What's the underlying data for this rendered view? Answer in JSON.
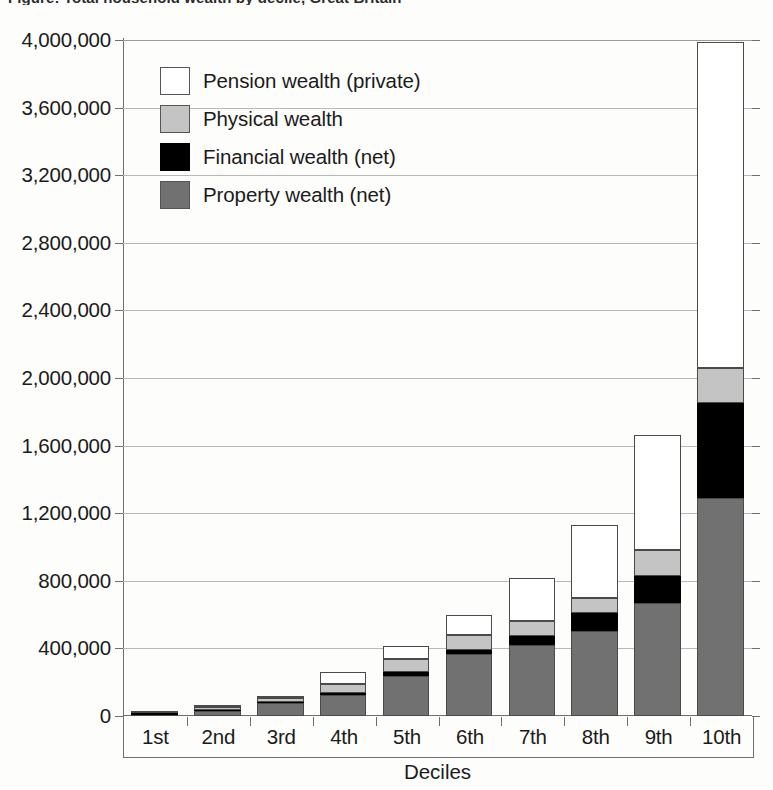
{
  "figure": {
    "clipped_title": "Figure: Total household wealth by decile, Great Britain",
    "xaxis_title": "Deciles"
  },
  "legend": {
    "items": [
      {
        "label": "Pension wealth (private)",
        "key": "pension",
        "color": "#ffffff"
      },
      {
        "label": "Physical wealth",
        "key": "physical",
        "color": "#c4c4c4"
      },
      {
        "label": "Financial wealth (net)",
        "key": "financial",
        "color": "#000000"
      },
      {
        "label": "Property wealth (net)",
        "key": "property",
        "color": "#717171"
      }
    ]
  },
  "yaxis": {
    "ticks": [
      {
        "value": 4000000,
        "label": "4,000,000"
      },
      {
        "value": 3600000,
        "label": "3,600,000"
      },
      {
        "value": 3200000,
        "label": "3,200,000"
      },
      {
        "value": 2800000,
        "label": "2,800,000"
      },
      {
        "value": 2400000,
        "label": "2,400,000"
      },
      {
        "value": 2000000,
        "label": "2,000,000"
      },
      {
        "value": 1600000,
        "label": "1,600,000"
      },
      {
        "value": 1200000,
        "label": "1,200,000"
      },
      {
        "value": 800000,
        "label": "800,000"
      },
      {
        "value": 400000,
        "label": "400,000"
      },
      {
        "value": 0,
        "label": "0"
      }
    ]
  },
  "chart_data": {
    "type": "bar",
    "stacked": true,
    "title": "Total household wealth by decile",
    "xlabel": "Deciles",
    "ylabel": "",
    "ylim": [
      0,
      4000000
    ],
    "ytick_step": 400000,
    "grid": true,
    "legend_position": "inside-top-left",
    "categories": [
      "1st",
      "2nd",
      "3rd",
      "4th",
      "5th",
      "6th",
      "7th",
      "8th",
      "9th",
      "10th"
    ],
    "series": [
      {
        "name": "Property wealth (net)",
        "color": "#717171",
        "values": [
          8000,
          30000,
          75000,
          125000,
          235000,
          365000,
          420000,
          505000,
          670000,
          1290000
        ]
      },
      {
        "name": "Financial wealth (net)",
        "color": "#000000",
        "values": [
          9000,
          5000,
          5000,
          12000,
          25000,
          28000,
          55000,
          105000,
          160000,
          565000
        ]
      },
      {
        "name": "Physical wealth",
        "color": "#c4c4c4",
        "values": [
          2000,
          17000,
          25000,
          55000,
          80000,
          85000,
          85000,
          90000,
          155000,
          205000
        ]
      },
      {
        "name": "Pension wealth (private)",
        "color": "#ffffff",
        "values": [
          1000,
          3000,
          10000,
          68000,
          75000,
          122000,
          255000,
          430000,
          675000,
          1930000
        ]
      }
    ],
    "totals": [
      20000,
      55000,
      115000,
      260000,
      415000,
      600000,
      815000,
      1130000,
      1660000,
      3990000
    ]
  }
}
